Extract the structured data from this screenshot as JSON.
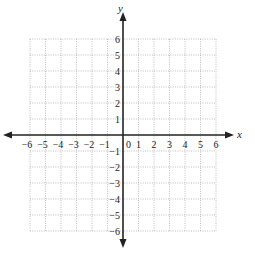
{
  "diagram": {
    "type": "coordinate-plane",
    "x_axis_label": "x",
    "y_axis_label": "y",
    "origin_label": "0",
    "x_range": [
      -6,
      6
    ],
    "y_range": [
      -6,
      6
    ],
    "x_ticks": [
      "-6",
      "-5",
      "-4",
      "-3",
      "-2",
      "-1",
      "1",
      "2",
      "3",
      "4",
      "5",
      "6"
    ],
    "y_ticks": [
      "6",
      "5",
      "4",
      "3",
      "2",
      "1",
      "-1",
      "-2",
      "-3",
      "-4",
      "-5",
      "-6"
    ],
    "grid_style": "dotted",
    "colors": {
      "axis": "#222222",
      "grid": "#b5b5b5",
      "background": "#ffffff"
    }
  }
}
